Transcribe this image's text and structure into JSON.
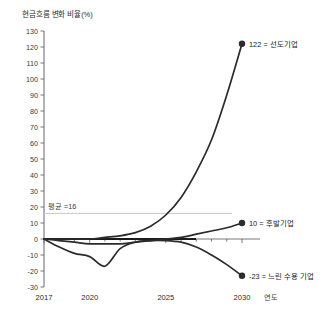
{
  "chart_data": {
    "type": "line",
    "title": "현금흐름 변화 비율(%)",
    "xlabel": "연도",
    "ylabel": "현금흐름 변화 비율(%)",
    "xlim": [
      2017,
      2030
    ],
    "ylim": [
      -30,
      130
    ],
    "ytick_step": 10,
    "yticks": [
      130,
      120,
      110,
      100,
      90,
      80,
      70,
      60,
      50,
      40,
      30,
      20,
      10,
      0,
      -10,
      -20,
      -30
    ],
    "xticks": [
      2017,
      2020,
      2025,
      2030
    ],
    "grid": false,
    "legend": "inline-annotations",
    "reference_lines": [
      {
        "name": "평균",
        "label": "평균 =16",
        "value": 16,
        "color": "#c9c9c9"
      },
      {
        "name": "zero-baseline",
        "label": "",
        "value": 0,
        "color": "#1a1a1a"
      }
    ],
    "series": [
      {
        "name": "선도기업",
        "end_label": "122 = 선도기업",
        "end_value": 122,
        "color": "#2b2b2b",
        "x": [
          2017,
          2018,
          2019,
          2020,
          2021,
          2022,
          2023,
          2024,
          2025,
          2026,
          2027,
          2028,
          2029,
          2030
        ],
        "values": [
          0,
          0,
          0,
          0,
          1,
          2,
          4,
          8,
          15,
          26,
          42,
          62,
          90,
          122
        ]
      },
      {
        "name": "후발기업",
        "end_label": "10 = 후발기업",
        "end_value": 10,
        "color": "#2b2b2b",
        "x": [
          2017,
          2018,
          2019,
          2020,
          2021,
          2022,
          2023,
          2024,
          2025,
          2026,
          2027,
          2028,
          2029,
          2030
        ],
        "values": [
          0,
          -1,
          -2,
          -3,
          -3,
          -3,
          -2,
          -1,
          0,
          1,
          3,
          5,
          7,
          10
        ]
      },
      {
        "name": "느린 수용 기업",
        "end_label": "-23 = 느린 수용 기업",
        "end_value": -23,
        "color": "#2b2b2b",
        "x": [
          2017,
          2018,
          2019,
          2020,
          2021,
          2022,
          2023,
          2024,
          2025,
          2026,
          2027,
          2028,
          2029,
          2030
        ],
        "values": [
          0,
          -5,
          -9,
          -11,
          -17,
          -6,
          -2,
          -1,
          -1,
          -2,
          -5,
          -10,
          -16,
          -23
        ]
      }
    ]
  }
}
